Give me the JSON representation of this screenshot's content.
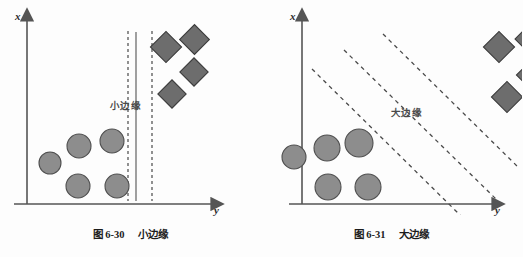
{
  "figure": {
    "background_color": "#fdfdfd",
    "axis_color": "#555555",
    "circle_fill": "#8d8d8d",
    "circle_stroke": "#4f4f4f",
    "diamond_fill": "#6d6d6d",
    "diamond_stroke": "#3c3c3c",
    "dashed_line_color": "#4a4a4a",
    "solid_line_color": "#6e6e6e"
  },
  "panels": [
    {
      "id": "small-margin",
      "axis": {
        "x_axis_label": "x",
        "y_axis_label": "y"
      },
      "margin_label": "小边缘",
      "caption": {
        "number": "图 6-30",
        "title": "小边缘"
      },
      "boundary": {
        "type": "vertical",
        "solid_x": 136,
        "dashed_x": [
          128,
          152
        ],
        "margin_width_px": 24
      },
      "circles": [
        {
          "cx": 50,
          "cy": 163,
          "r": 11
        },
        {
          "cx": 79,
          "cy": 146,
          "r": 12
        },
        {
          "cx": 112,
          "cy": 141,
          "r": 12
        },
        {
          "cx": 78,
          "cy": 186,
          "r": 12
        },
        {
          "cx": 117,
          "cy": 186,
          "r": 12
        }
      ],
      "diamonds": [
        {
          "cx": 166,
          "cy": 47,
          "r": 13
        },
        {
          "cx": 194,
          "cy": 39,
          "r": 14
        },
        {
          "cx": 194,
          "cy": 72,
          "r": 13
        },
        {
          "cx": 172,
          "cy": 94,
          "r": 13
        }
      ]
    },
    {
      "id": "large-margin",
      "axis": {
        "x_axis_label": "x",
        "y_axis_label": "y"
      },
      "margin_label": "大边缘",
      "caption": {
        "number": "图 6-31",
        "title": "大边缘"
      },
      "boundary": {
        "type": "diagonal",
        "slope": -1,
        "dashed_lines": 3,
        "margin_width_px": 62
      },
      "circles": [
        {
          "cx": 33,
          "cy": 157,
          "r": 12
        },
        {
          "cx": 66,
          "cy": 148,
          "r": 13
        },
        {
          "cx": 98,
          "cy": 143,
          "r": 14
        },
        {
          "cx": 67,
          "cy": 187,
          "r": 13
        },
        {
          "cx": 107,
          "cy": 187,
          "r": 13
        }
      ],
      "diamonds": [
        {
          "cx": 238,
          "cy": 47,
          "r": 14
        },
        {
          "cx": 271,
          "cy": 39,
          "r": 15
        },
        {
          "cx": 271,
          "cy": 75,
          "r": 14
        },
        {
          "cx": 246,
          "cy": 97,
          "r": 14
        }
      ]
    }
  ]
}
